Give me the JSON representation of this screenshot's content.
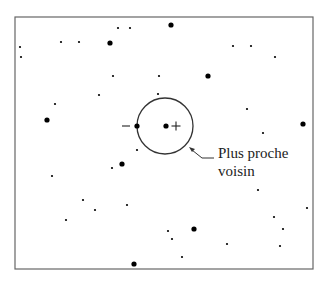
{
  "diagram": {
    "type": "nearest-neighbor-illustration",
    "frame": {
      "x": 15,
      "y": 17,
      "width": 298,
      "height": 252,
      "stroke": "#666666"
    },
    "query_point": {
      "x": 166,
      "y": 126,
      "r": 2.6,
      "sign": "+"
    },
    "nearest_neighbor": {
      "x": 137,
      "y": 126,
      "r": 2.6,
      "sign": "−"
    },
    "circle": {
      "cx": 165,
      "cy": 126,
      "r": 28,
      "stroke": "#333333"
    },
    "annotation": {
      "line1": "Plus proche",
      "line2": "voisin"
    },
    "large_points": [
      [
        171,
        25
      ],
      [
        110,
        43
      ],
      [
        208,
        76
      ],
      [
        47,
        120
      ],
      [
        303,
        124
      ],
      [
        122,
        164
      ],
      [
        194,
        229
      ],
      [
        134,
        264
      ]
    ],
    "small_points": [
      [
        118,
        28
      ],
      [
        130,
        28
      ],
      [
        20,
        47
      ],
      [
        21,
        57
      ],
      [
        61,
        42
      ],
      [
        79,
        42
      ],
      [
        233,
        46
      ],
      [
        251,
        46
      ],
      [
        275,
        57
      ],
      [
        113,
        76
      ],
      [
        159,
        76
      ],
      [
        99,
        95
      ],
      [
        158,
        94
      ],
      [
        55,
        104
      ],
      [
        247,
        109
      ],
      [
        263,
        133
      ],
      [
        137,
        150
      ],
      [
        112,
        168
      ],
      [
        52,
        176
      ],
      [
        258,
        190
      ],
      [
        83,
        200
      ],
      [
        95,
        210
      ],
      [
        127,
        205
      ],
      [
        66,
        220
      ],
      [
        307,
        208
      ],
      [
        274,
        217
      ],
      [
        283,
        229
      ],
      [
        168,
        231
      ],
      [
        172,
        239
      ],
      [
        227,
        244
      ],
      [
        280,
        246
      ],
      [
        182,
        257
      ]
    ],
    "colors": {
      "point": "#000000",
      "text": "#222222"
    }
  }
}
